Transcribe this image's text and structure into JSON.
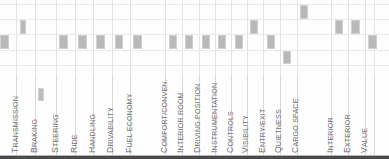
{
  "chart_data": {
    "type": "bar",
    "title": "",
    "subtitle": "",
    "xlabel": "",
    "ylabel": "",
    "orientation": "vertical",
    "grid": true,
    "legend_position": "none",
    "bar_color": "#b9b9b9",
    "gridline_color": "#e9e9e9",
    "label_color": "#6e6e6e",
    "axis_rule_color": "#4a4a4a",
    "rating_levels": [
      "Excellent",
      "Very Good",
      "Good",
      "Fair",
      "Poor"
    ],
    "row_count": 5,
    "note": "Each category shows a single filled cell marking its rating level; row 0 is the top (best) band.",
    "categories": [
      "Acceleration",
      "Transmission",
      "Braking",
      "Steering",
      "Ride",
      "Handling",
      "Drivability",
      "Fuel Economy",
      "Comfort/Conven.",
      "Interior Room",
      "Driving Position",
      "Instrumentation",
      "Controls",
      "Visibility",
      "Entry/Exit",
      "Quietness",
      "Cargo Space",
      "Interior",
      "Exterior",
      "Value"
    ],
    "values": [
      2,
      1,
      3,
      2,
      2,
      2,
      2,
      2,
      2,
      2,
      2,
      2,
      2,
      1,
      2,
      3,
      0,
      1,
      1,
      2
    ],
    "bars": [
      {
        "category": "Acceleration",
        "row": 2,
        "x": 0,
        "w": 22
      },
      {
        "category": "Transmission",
        "row": 1,
        "x": 49,
        "w": 15
      },
      {
        "category": "Braking",
        "row": 3,
        "x": 96,
        "w": 15
      },
      {
        "category": "Steering",
        "row": 2,
        "x": 148,
        "w": 21
      },
      {
        "category": "Ride",
        "row": 2,
        "x": 196,
        "w": 21
      },
      {
        "category": "Handling",
        "row": 2,
        "x": 241,
        "w": 21
      },
      {
        "category": "Drivability",
        "row": 2,
        "x": 287,
        "w": 21
      },
      {
        "category": "Fuel Economy",
        "row": 2,
        "x": 333,
        "w": 21
      },
      {
        "category": "Comfort/Conven.",
        "row": 2,
        "x": 421,
        "w": 21
      },
      {
        "category": "Interior Room",
        "row": 2,
        "x": 462,
        "w": 21
      },
      {
        "category": "Driving Position",
        "row": 2,
        "x": 504,
        "w": 21
      },
      {
        "category": "Instrumentation",
        "row": 2,
        "x": 545,
        "w": 21
      },
      {
        "category": "Controls",
        "row": 2,
        "x": 586,
        "w": 21
      },
      {
        "category": "Visibility",
        "row": 1,
        "x": 624,
        "w": 21
      },
      {
        "category": "Entry/Exit",
        "row": 2,
        "x": 666,
        "w": 21
      },
      {
        "category": "Quietness",
        "row": 3,
        "x": 707,
        "w": 21
      },
      {
        "category": "Cargo Space",
        "row": 0,
        "x": 749,
        "w": 21
      },
      {
        "category": "Interior",
        "row": 1,
        "x": 836,
        "w": 21
      },
      {
        "category": "Exterior",
        "row": 1,
        "x": 878,
        "w": 21
      },
      {
        "category": "Value",
        "row": 2,
        "x": 920,
        "w": 21
      }
    ]
  },
  "labels": {
    "acceleration": "Acceleration",
    "transmission": "Transmission",
    "braking": "Braking",
    "steering": "Steering",
    "ride": "Ride",
    "handling": "Handling",
    "drivability": "Drivability",
    "fuel_economy": "Fuel Economy",
    "comfort_conven": "Comfort/Conven.",
    "interior_room": "Interior Room",
    "driving_position": "Driving Position",
    "instrumentation": "Instrumentation",
    "controls": "Controls",
    "visibility": "Visibility",
    "entry_exit": "Entry/Exit",
    "quietness": "Quietness",
    "cargo_space": "Cargo Space",
    "interior": "Interior",
    "exterior": "Exterior",
    "value": "Value"
  }
}
